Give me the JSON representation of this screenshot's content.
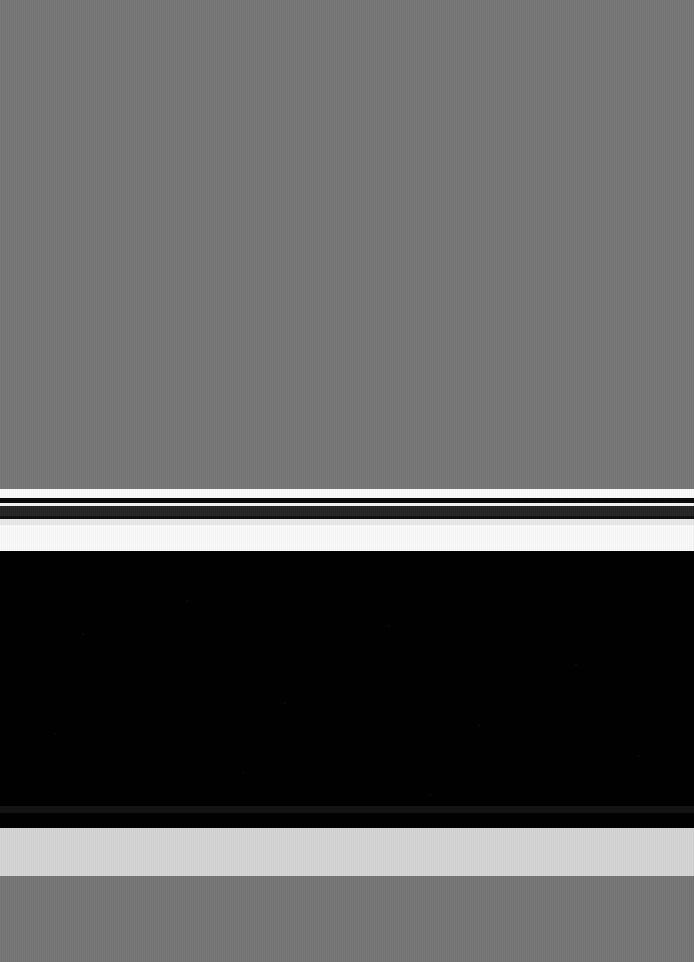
{
  "meta": {
    "width": 694,
    "height": 962
  },
  "palette": {
    "desktop_backdrop": "#767676",
    "bottom_backdrop": "#757575",
    "chrome_light": "#fafafa",
    "chrome_gap_top": "#fbfbfb",
    "chrome_rule_upper": "#0a0a0a",
    "chrome_gap_mid": "#f4f4f4",
    "chrome_toolbar_dark": "#232323",
    "chrome_rule_lower": "#101010",
    "chrome_gap_lower": "#e9e9e9",
    "content_viewport": "#010101",
    "scrollbar_track": "#141414",
    "status_band": "#d5d5d5"
  },
  "desktop": {
    "backdrop_label": "",
    "bottom_backdrop_label": ""
  },
  "window": {
    "title": "",
    "chrome": {
      "titlebar_label": "",
      "toolbar_label": "",
      "tabstrip_label": "",
      "separator_upper_label": "",
      "separator_lower_label": ""
    },
    "content": {
      "viewport_label": "",
      "scrollbar_label": ""
    },
    "status": {
      "status_label": ""
    }
  }
}
